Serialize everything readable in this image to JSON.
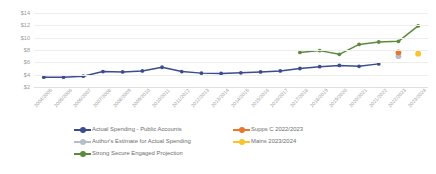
{
  "chart_data": {
    "type": "line",
    "title": "",
    "xlabel": "",
    "ylabel": "",
    "ylim": [
      2,
      14
    ],
    "ytick_labels": [
      "$14",
      "$12",
      "$10",
      "$8",
      "$6",
      "$4",
      "$2"
    ],
    "ytick_values": [
      14,
      12,
      10,
      8,
      6,
      4,
      2
    ],
    "grid": true,
    "legend_position": "bottom",
    "categories": [
      "2004/2005",
      "2005/2006",
      "2006/2007",
      "2007/2008",
      "2008/2009",
      "2009/2010",
      "2010/2011",
      "2011/2012",
      "2012/2013",
      "2013/2014",
      "2014/2015",
      "2015/2016",
      "2016/2017",
      "2017/2018",
      "2018/2019",
      "2019/2020",
      "2020/2021",
      "2021/2022",
      "2022/2023",
      "2023/2024"
    ],
    "series": [
      {
        "name": "Actual Spending - Public Accounts",
        "color": "#3b4d8f",
        "marker": "circle",
        "values": [
          3.6,
          3.6,
          3.75,
          4.5,
          4.45,
          4.6,
          5.2,
          4.5,
          4.25,
          4.2,
          4.3,
          4.45,
          4.6,
          5.0,
          5.3,
          5.5,
          5.35,
          5.75,
          null,
          null
        ]
      },
      {
        "name": "Author's Estimate for Actual Spending",
        "color": "#b6bfc9",
        "marker": "circle",
        "values": [
          null,
          null,
          null,
          null,
          null,
          null,
          null,
          null,
          null,
          null,
          null,
          null,
          null,
          null,
          null,
          null,
          null,
          null,
          7.0,
          null
        ]
      },
      {
        "name": "Supps C 2022/2023",
        "color": "#e8762c",
        "marker": "circle",
        "values": [
          null,
          null,
          null,
          null,
          null,
          null,
          null,
          null,
          null,
          null,
          null,
          null,
          null,
          null,
          null,
          null,
          null,
          null,
          7.6,
          null
        ]
      },
      {
        "name": "Mains 2023/2024",
        "color": "#f7c42a",
        "marker": "circle",
        "values": [
          null,
          null,
          null,
          null,
          null,
          null,
          null,
          null,
          null,
          null,
          null,
          null,
          null,
          null,
          null,
          null,
          null,
          null,
          null,
          7.4
        ]
      },
      {
        "name": "Strong Secure Engaged Projection",
        "color": "#5d8a3e",
        "marker": "circle",
        "values": [
          null,
          null,
          null,
          null,
          null,
          null,
          null,
          null,
          null,
          null,
          null,
          null,
          null,
          7.6,
          7.9,
          7.3,
          8.9,
          9.3,
          9.4,
          11.9
        ]
      }
    ],
    "legend": [
      {
        "label": "Actual Spending - Public Accounts",
        "color": "#3b4d8f"
      },
      {
        "label": "Supps C 2022/2023",
        "color": "#e8762c"
      },
      {
        "label": "Author's Estimate for Actual Spending",
        "color": "#b6bfc9"
      },
      {
        "label": "Mains 2023/2024",
        "color": "#f7c42a"
      },
      {
        "label": "Strong Secure Engaged Projection",
        "color": "#5d8a3e"
      }
    ]
  }
}
